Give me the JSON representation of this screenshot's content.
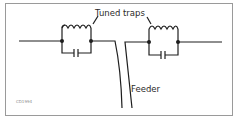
{
  "diagram": {
    "title_label": "Tuned traps",
    "feeder_label": "Feeder",
    "credit": "CD1994",
    "colors": {
      "line": "#1e1e1e",
      "frame": "#9a9a9a",
      "text": "#2a2a2a",
      "credit": "#8a8a8a"
    },
    "components": [
      {
        "name": "left-trap",
        "type": "parallel LC trap",
        "parts": [
          "inductor",
          "capacitor"
        ]
      },
      {
        "name": "right-trap",
        "type": "parallel LC trap",
        "parts": [
          "inductor",
          "capacitor"
        ]
      },
      {
        "name": "feeder",
        "type": "twin-lead transmission line"
      }
    ]
  }
}
